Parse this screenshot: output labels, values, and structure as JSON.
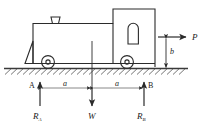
{
  "figure": {
    "name": "locomotive-free-body-diagram",
    "stroke_color": "#2b2b2b",
    "ground_color": "#3a3a3a",
    "background": "#ffffff"
  },
  "forces": {
    "applied": {
      "symbol": "P",
      "direction": "right",
      "name": "applied-horizontal-force"
    },
    "weight": {
      "symbol": "W",
      "direction": "down",
      "name": "weight-force"
    },
    "reaction_a": {
      "symbol": "R",
      "subscript": "A",
      "direction": "up",
      "name": "reaction-at-a"
    },
    "reaction_b": {
      "symbol": "R",
      "subscript": "B",
      "direction": "up",
      "name": "reaction-at-b"
    }
  },
  "points": {
    "a": "A",
    "b": "B"
  },
  "dimensions": {
    "left_span": "a",
    "right_span": "a",
    "height": "b"
  },
  "parts": {
    "smokestack": "smokestack",
    "boiler": "boiler",
    "cab": "cab",
    "window": "cab-window",
    "cowcatcher": "cowcatcher",
    "front_wheel": "front-wheel",
    "rear_wheel": "rear-wheel",
    "ground": "ground-hatching"
  }
}
